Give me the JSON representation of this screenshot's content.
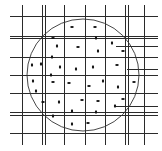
{
  "diagram": {
    "colors": {
      "line": "#2a2a2a",
      "background": "#ffffff",
      "dot": "#111111",
      "circle": "#333333"
    },
    "circle": {
      "cx": 83,
      "cy": 75,
      "r": 56
    },
    "vertical_lines": [
      {
        "x": 22,
        "y1": 5,
        "y2": 145
      },
      {
        "x": 42,
        "y1": 5,
        "y2": 145
      },
      {
        "x": 45,
        "y1": 5,
        "y2": 145
      },
      {
        "x": 64,
        "y1": 5,
        "y2": 145
      },
      {
        "x": 85,
        "y1": 5,
        "y2": 145
      },
      {
        "x": 105,
        "y1": 5,
        "y2": 145
      },
      {
        "x": 125,
        "y1": 5,
        "y2": 145
      },
      {
        "x": 128,
        "y1": 5,
        "y2": 145
      },
      {
        "x": 144,
        "y1": 5,
        "y2": 145
      }
    ],
    "horizontal_lines": [
      {
        "y": 16,
        "x1": 10,
        "x2": 158
      },
      {
        "y": 36,
        "x1": 10,
        "x2": 158
      },
      {
        "y": 38,
        "x1": 10,
        "x2": 158
      },
      {
        "y": 46,
        "x1": 116,
        "x2": 158
      },
      {
        "y": 57,
        "x1": 10,
        "x2": 158
      },
      {
        "y": 69,
        "x1": 127,
        "x2": 158
      },
      {
        "y": 75,
        "x1": 10,
        "x2": 158
      },
      {
        "y": 93,
        "x1": 10,
        "x2": 158
      },
      {
        "y": 106,
        "x1": 116,
        "x2": 158
      },
      {
        "y": 112,
        "x1": 10,
        "x2": 158
      },
      {
        "y": 115,
        "x1": 10,
        "x2": 158
      },
      {
        "y": 133,
        "x1": 10,
        "x2": 158
      }
    ],
    "dots": [
      {
        "x": 72,
        "y": 27,
        "orient": "h"
      },
      {
        "x": 95,
        "y": 27,
        "orient": "h"
      },
      {
        "x": 53,
        "y": 38,
        "orient": "h"
      },
      {
        "x": 96,
        "y": 38,
        "orient": "v"
      },
      {
        "x": 57,
        "y": 46,
        "orient": "v"
      },
      {
        "x": 78,
        "y": 47,
        "orient": "h"
      },
      {
        "x": 112,
        "y": 43,
        "orient": "v"
      },
      {
        "x": 98,
        "y": 51,
        "orient": "v"
      },
      {
        "x": 123,
        "y": 51,
        "orient": "h"
      },
      {
        "x": 52,
        "y": 57,
        "orient": "v"
      },
      {
        "x": 32,
        "y": 65,
        "orient": "v"
      },
      {
        "x": 41,
        "y": 64,
        "orient": "v"
      },
      {
        "x": 60,
        "y": 67,
        "orient": "v"
      },
      {
        "x": 76,
        "y": 69,
        "orient": "v"
      },
      {
        "x": 93,
        "y": 67,
        "orient": "v"
      },
      {
        "x": 117,
        "y": 65,
        "orient": "h"
      },
      {
        "x": 51,
        "y": 75,
        "orient": "v"
      },
      {
        "x": 33,
        "y": 81,
        "orient": "v"
      },
      {
        "x": 53,
        "y": 82,
        "orient": "h"
      },
      {
        "x": 69,
        "y": 83,
        "orient": "h"
      },
      {
        "x": 89,
        "y": 86,
        "orient": "h"
      },
      {
        "x": 103,
        "y": 81,
        "orient": "v"
      },
      {
        "x": 118,
        "y": 87,
        "orient": "v"
      },
      {
        "x": 134,
        "y": 82,
        "orient": "h"
      },
      {
        "x": 36,
        "y": 91,
        "orient": "v"
      },
      {
        "x": 43,
        "y": 102,
        "orient": "h"
      },
      {
        "x": 59,
        "y": 102,
        "orient": "v"
      },
      {
        "x": 82,
        "y": 100,
        "orient": "h"
      },
      {
        "x": 98,
        "y": 101,
        "orient": "h"
      },
      {
        "x": 123,
        "y": 99,
        "orient": "h"
      },
      {
        "x": 115,
        "y": 106,
        "orient": "v"
      },
      {
        "x": 72,
        "y": 111,
        "orient": "v"
      },
      {
        "x": 96,
        "y": 112,
        "orient": "v"
      },
      {
        "x": 53,
        "y": 116,
        "orient": "v"
      },
      {
        "x": 72,
        "y": 124,
        "orient": "v"
      },
      {
        "x": 88,
        "y": 123,
        "orient": "h"
      }
    ]
  }
}
